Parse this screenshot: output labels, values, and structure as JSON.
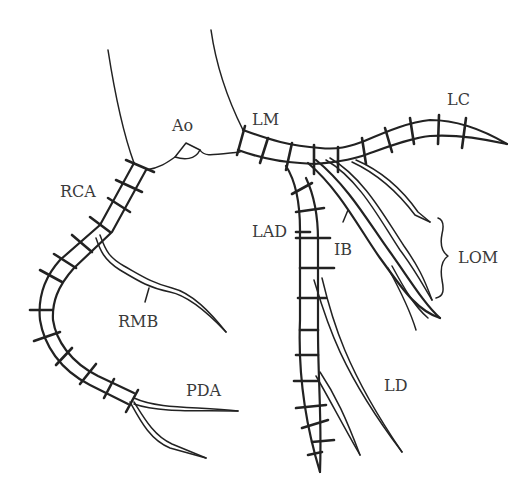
{
  "diagram": {
    "labels": [
      {
        "id": "ao",
        "text": "Ao",
        "x": 172,
        "y": 118
      },
      {
        "id": "lm",
        "text": "LM",
        "x": 252,
        "y": 112
      },
      {
        "id": "lc",
        "text": "LC",
        "x": 447,
        "y": 92
      },
      {
        "id": "rca",
        "text": "RCA",
        "x": 60,
        "y": 184
      },
      {
        "id": "lad",
        "text": "LAD",
        "x": 252,
        "y": 224
      },
      {
        "id": "ib",
        "text": "IB",
        "x": 334,
        "y": 242
      },
      {
        "id": "lom",
        "text": "LOM",
        "x": 458,
        "y": 250
      },
      {
        "id": "rmb",
        "text": "RMB",
        "x": 118,
        "y": 314
      },
      {
        "id": "pda",
        "text": "PDA",
        "x": 186,
        "y": 383
      },
      {
        "id": "ld",
        "text": "LD",
        "x": 384,
        "y": 378
      }
    ],
    "stroke_color": "#222222",
    "label_color": "#3a3a3a"
  }
}
